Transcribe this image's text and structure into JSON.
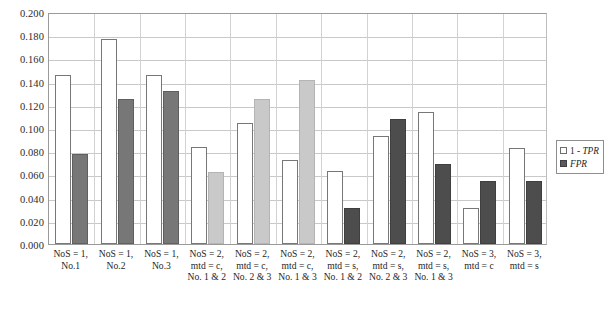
{
  "chart_data": {
    "type": "bar",
    "title": "",
    "xlabel": "",
    "ylabel": "",
    "ylim": [
      0.0,
      0.2
    ],
    "ytick_labels": [
      "0.200",
      "0.180",
      "0.160",
      "0.140",
      "0.120",
      "0.100",
      "0.080",
      "0.060",
      "0.040",
      "0.020",
      "0.000"
    ],
    "ytick_values": [
      0.2,
      0.18,
      0.16,
      0.14,
      0.12,
      0.1,
      0.08,
      0.06,
      0.04,
      0.02,
      0.0
    ],
    "grid": true,
    "legend_position": "right",
    "categories": [
      "NoS = 1, No.1",
      "NoS = 1, No.2",
      "NoS = 1, No.3",
      "NoS = 2, mtd = c, No. 1 & 2",
      "NoS = 2, mtd = c, No. 2 & 3",
      "NoS = 2, mtd = c, No. 1 & 3",
      "NoS = 2, mtd = s, No. 1 & 2",
      "NoS = 2, mtd = s, No. 2 & 3",
      "NoS = 2, mtd = s, No. 1 & 3",
      "NoS = 3, mtd = c",
      "NoS = 3, mtd = s"
    ],
    "category_lines": [
      [
        "NoS = 1,",
        "No.1"
      ],
      [
        "NoS = 1,",
        "No.2"
      ],
      [
        "NoS = 1,",
        "No.3"
      ],
      [
        "NoS = 2,",
        "mtd = c,",
        "No. 1 & 2"
      ],
      [
        "NoS = 2,",
        "mtd = c,",
        "No. 2 & 3"
      ],
      [
        "NoS = 2,",
        "mtd = c,",
        "No. 1 & 3"
      ],
      [
        "NoS = 2,",
        "mtd = s,",
        "No. 1 & 2"
      ],
      [
        "NoS = 2,",
        "mtd = s,",
        "No. 2 & 3"
      ],
      [
        "NoS = 2,",
        "mtd = s,",
        "No. 1 & 3"
      ],
      [
        "NoS = 3,",
        "mtd = c"
      ],
      [
        "NoS = 3,",
        "mtd = s"
      ]
    ],
    "series": [
      {
        "name": "1 - TPR",
        "values": [
          0.146,
          0.177,
          0.146,
          0.084,
          0.104,
          0.072,
          0.063,
          0.093,
          0.114,
          0.031,
          0.083
        ]
      },
      {
        "name": "FPR",
        "values": [
          0.078,
          0.125,
          0.132,
          0.062,
          0.125,
          0.141,
          0.031,
          0.108,
          0.069,
          0.054,
          0.054
        ]
      }
    ],
    "bar_shades": [
      "dark",
      "dark",
      "dark",
      "light",
      "light",
      "light",
      "darker",
      "darker",
      "darker",
      "darker",
      "darker"
    ]
  },
  "legend": {
    "items": [
      {
        "label_prefix": "1 - ",
        "label_italic": "TPR",
        "swatch": "white-square-swatch"
      },
      {
        "label_prefix": "",
        "label_italic": "FPR",
        "swatch": "dark-square-swatch"
      }
    ]
  }
}
